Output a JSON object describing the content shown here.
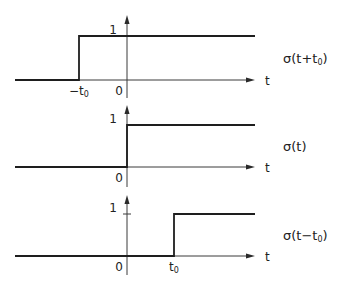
{
  "diagram": {
    "title": "",
    "panels": [
      {
        "id": "shift-left",
        "function_label": "σ(t+t₀)",
        "function_label_parts": {
          "pre": "σ(t+t",
          "sub": "0",
          "post": ")"
        },
        "x_axis_label": "t",
        "y_tick_label": "1",
        "origin_label": "0",
        "step_label": "−t₀",
        "step_label_parts": {
          "pre": "−t",
          "sub": "0"
        },
        "geom": {
          "axis_x": 127,
          "arrow_top": 15,
          "axis_bottom": 98,
          "level1_y": 36,
          "base_y": 80,
          "step_x": 79,
          "left_x": 15,
          "right_x": 255
        }
      },
      {
        "id": "unit-step",
        "function_label": "σ(t)",
        "function_label_parts": {
          "pre": "σ(t",
          "sub": "",
          "post": ")"
        },
        "x_axis_label": "t",
        "y_tick_label": "1",
        "origin_label": "0",
        "step_label": "",
        "geom": {
          "axis_x": 127,
          "arrow_top": 105,
          "axis_bottom": 187,
          "level1_y": 125,
          "base_y": 167,
          "step_x": 127,
          "left_x": 15,
          "right_x": 255
        }
      },
      {
        "id": "shift-right",
        "function_label": "σ(t−t₀)",
        "function_label_parts": {
          "pre": "σ(t−t",
          "sub": "0",
          "post": ")"
        },
        "x_axis_label": "t",
        "y_tick_label": "1",
        "origin_label": "0",
        "step_label": "t₀",
        "step_label_parts": {
          "pre": "t",
          "sub": "0"
        },
        "geom": {
          "axis_x": 127,
          "arrow_top": 195,
          "axis_bottom": 275,
          "level1_y": 214,
          "base_y": 256,
          "step_x": 174,
          "left_x": 15,
          "right_x": 255
        }
      }
    ],
    "colors": {
      "line": "#1e1e1e",
      "axis": "#3a3a3a",
      "background": "#ffffff"
    }
  }
}
